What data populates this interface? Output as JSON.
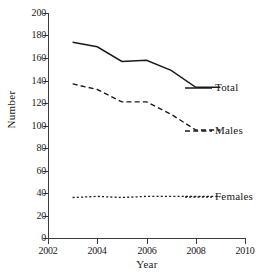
{
  "chart_data": {
    "type": "line",
    "title": "",
    "xlabel": "Year",
    "ylabel": "Number",
    "xlim": [
      2002,
      2010
    ],
    "ylim": [
      0,
      200
    ],
    "xticks": [
      2002,
      2004,
      2006,
      2008,
      2010
    ],
    "yticks": [
      0,
      20,
      40,
      60,
      80,
      100,
      120,
      140,
      160,
      180,
      200
    ],
    "grid": false,
    "legend_position": "inline-right",
    "x": [
      2003,
      2004,
      2005,
      2006,
      2007,
      2008,
      2009
    ],
    "series": [
      {
        "name": "Total",
        "style": "solid",
        "color": "#1a1a1a",
        "values": [
          174,
          170,
          157,
          158,
          149,
          134,
          134
        ]
      },
      {
        "name": "Males",
        "style": "dashed",
        "color": "#1a1a1a",
        "values": [
          137,
          132,
          121,
          121,
          110,
          96,
          96
        ]
      },
      {
        "name": "Females",
        "style": "dotted",
        "color": "#1a1a1a",
        "values": [
          36,
          37,
          36,
          37,
          37,
          37,
          37
        ]
      }
    ]
  },
  "axes": {
    "y_tick_labels": [
      "200",
      "180",
      "160",
      "140",
      "120",
      "100",
      "80",
      "60",
      "40",
      "20",
      "0"
    ],
    "x_tick_labels": [
      "2002",
      "2004",
      "2006",
      "2008",
      "2010"
    ],
    "y_axis_title": "Number",
    "x_axis_title": "Year"
  },
  "labels": {
    "total": "Total",
    "males": "Males",
    "females": "Females"
  }
}
